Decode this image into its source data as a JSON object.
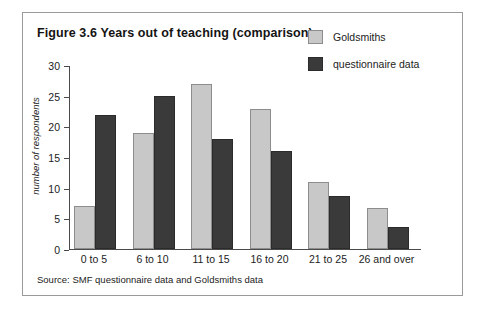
{
  "figure": {
    "title": "Figure 3.6 Years out of teaching (comparison)",
    "source": "Source: SMF questionnaire data and Goldsmiths data",
    "frame_color": "#9a9a9a",
    "background": "#ffffff"
  },
  "legend": {
    "position": "top-right",
    "entries": [
      {
        "label": "Goldsmiths",
        "color": "#c8c8c8"
      },
      {
        "label": "questionnaire data",
        "color": "#3a3a3a"
      }
    ]
  },
  "chart_data": {
    "type": "bar",
    "title": "Figure 3.6 Years out of teaching (comparison)",
    "xlabel": "",
    "ylabel": "number of respondents",
    "ylim": [
      0,
      30
    ],
    "yticks": [
      0,
      5,
      10,
      15,
      20,
      25,
      30
    ],
    "ytick_labels": [
      "0",
      "5",
      "10",
      "15",
      "20",
      "25",
      "30"
    ],
    "grid": false,
    "legend_position": "top-right",
    "categories": [
      "0 to 5",
      "6 to 10",
      "11 to 15",
      "16 to 20",
      "21 to 25",
      "26 and over"
    ],
    "series": [
      {
        "name": "Goldsmiths",
        "color": "#c8c8c8",
        "values": [
          7,
          19,
          27,
          23,
          11,
          6.7
        ]
      },
      {
        "name": "questionnaire data",
        "color": "#3a3a3a",
        "values": [
          22,
          25,
          18,
          16,
          8.7,
          3.6
        ]
      }
    ]
  }
}
